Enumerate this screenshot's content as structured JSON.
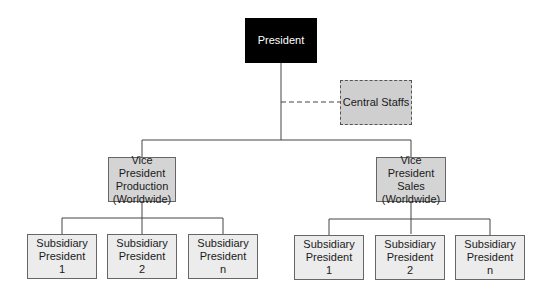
{
  "chart": {
    "president": {
      "label": "President"
    },
    "central_staffs": {
      "label": "Central Staffs"
    },
    "vp_production": {
      "lines": [
        "Vice President",
        "Production",
        "(Worldwide)"
      ]
    },
    "vp_sales": {
      "lines": [
        "Vice President",
        "Sales",
        "(Worldwide)"
      ]
    },
    "production_subsidiaries": [
      {
        "lines": [
          "Subsidiary",
          "President",
          "1"
        ]
      },
      {
        "lines": [
          "Subsidiary",
          "President",
          "2"
        ]
      },
      {
        "lines": [
          "Subsidiary",
          "President",
          "n"
        ]
      }
    ],
    "sales_subsidiaries": [
      {
        "lines": [
          "Subsidiary",
          "President",
          "1"
        ]
      },
      {
        "lines": [
          "Subsidiary",
          "President",
          "2"
        ]
      },
      {
        "lines": [
          "Subsidiary",
          "President",
          "n"
        ]
      }
    ]
  }
}
